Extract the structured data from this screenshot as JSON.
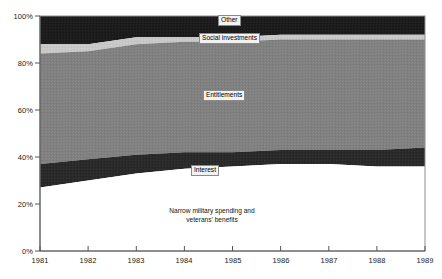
{
  "chart_data": {
    "type": "area",
    "title": "",
    "subtitle": "",
    "xlabel": "",
    "ylabel": "",
    "stacked": true,
    "normalized_percent": true,
    "grid": false,
    "legend_position": "inline-labels",
    "x": [
      1981,
      1982,
      1983,
      1984,
      1985,
      1986,
      1987,
      1988,
      1989
    ],
    "xtick_labels": [
      "1981",
      "1982",
      "1983",
      "1984",
      "1985",
      "1986",
      "1987",
      "1988",
      "1989"
    ],
    "ytick_labels": [
      "0%",
      "20%",
      "40%",
      "60%",
      "80%",
      "100%"
    ],
    "ytick_values": [
      0,
      20,
      40,
      60,
      80,
      100
    ],
    "ylim": [
      0,
      100
    ],
    "xlim": [
      1981,
      1989
    ],
    "series": [
      {
        "name": "Narrow military spending and veterans' benefits",
        "inline_label": "Narrow military spending and\nveterans' benefits",
        "color": "#ffffff",
        "values": [
          27,
          30,
          33,
          35,
          36,
          37,
          37,
          36,
          36
        ]
      },
      {
        "name": "Interest",
        "inline_label": "Interest",
        "color": "#2a2a2a",
        "values": [
          10,
          9,
          8,
          7,
          6,
          6,
          6,
          7,
          8
        ]
      },
      {
        "name": "Entitlements",
        "inline_label": "Entitlements",
        "color": "#808080",
        "values": [
          47,
          46,
          47,
          47,
          47,
          47,
          47,
          47,
          46
        ]
      },
      {
        "name": "Social investments",
        "inline_label": "Social investments",
        "color": "#c8c8c8",
        "values": [
          4,
          3,
          3,
          2,
          2,
          2,
          2,
          2,
          2
        ]
      },
      {
        "name": "Other",
        "inline_label": "Other",
        "color": "#1c1c1c",
        "values": [
          12,
          12,
          9,
          9,
          9,
          8,
          8,
          8,
          8
        ]
      }
    ],
    "cumulative_boundaries": {
      "military_top": [
        27,
        30,
        33,
        35,
        36,
        37,
        37,
        36,
        36
      ],
      "interest_top": [
        37,
        39,
        41,
        42,
        42,
        43,
        43,
        43,
        44
      ],
      "entitlements_top": [
        84,
        85,
        88,
        89,
        89,
        90,
        90,
        90,
        90
      ],
      "social_top": [
        88,
        88,
        91,
        91,
        91,
        92,
        92,
        92,
        92
      ],
      "other_top": [
        100,
        100,
        100,
        100,
        100,
        100,
        100,
        100,
        100
      ]
    }
  },
  "axes": {
    "y_ticks": [
      {
        "label": "100%",
        "value": 100
      },
      {
        "label": "80%",
        "value": 80
      },
      {
        "label": "60%",
        "value": 60
      },
      {
        "label": "40%",
        "value": 40
      },
      {
        "label": "20%",
        "value": 20
      },
      {
        "label": "0%",
        "value": 0
      }
    ],
    "x_ticks": [
      {
        "label": "1981"
      },
      {
        "label": "1982"
      },
      {
        "label": "1983"
      },
      {
        "label": "1984"
      },
      {
        "label": "1985"
      },
      {
        "label": "1986"
      },
      {
        "label": "1987"
      },
      {
        "label": "1988"
      },
      {
        "label": "1989"
      }
    ]
  },
  "labels": {
    "other": "Other",
    "social_investments": "Social investments",
    "entitlements": "Entitlements",
    "interest": "Interest",
    "military_line1": "Narrow military spending and",
    "military_line2": "veterans' benefits"
  },
  "colors": {
    "other": "#1c1c1c",
    "social_investments": "#c8c8c8",
    "entitlements": "#808080",
    "interest": "#2a2a2a",
    "military": "#ffffff",
    "axis": "#555555",
    "label_box_bg": "#f2f2f2",
    "label_box_border": "#8a8a8a",
    "text": "#1a1a1a"
  }
}
